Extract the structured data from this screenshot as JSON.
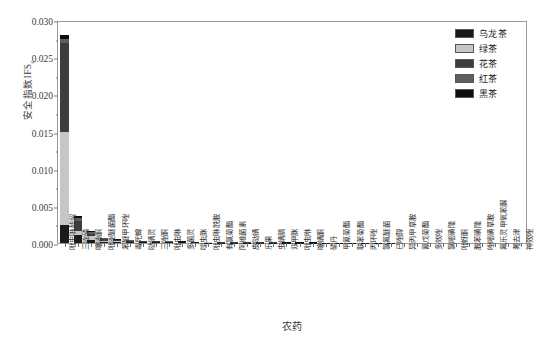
{
  "chart_data": {
    "type": "bar",
    "subtype": "stacked-bar",
    "title": "",
    "xlabel": "农药",
    "ylabel": "安全指数IFS",
    "ylabel_sub": "c",
    "ylim": [
      0.0,
      0.03
    ],
    "ytick_labels": [
      "0.000",
      "0.005",
      "0.010",
      "0.015",
      "0.020",
      "0.025",
      "0.030"
    ],
    "ytick_values": [
      0.0,
      0.005,
      0.01,
      0.015,
      0.02,
      0.025,
      0.03
    ],
    "grid": false,
    "legend_position": "top-right",
    "legend": [
      "乌龙茶",
      "绿茶",
      "花茶",
      "红茶",
      "黑茶"
    ],
    "colors": [
      "#1a1a1a",
      "#c6c6c6",
      "#3d3d3d",
      "#5e5e5e",
      "#0d0d0d"
    ],
    "categories": [
      "吡虫啉残留",
      "三唑磷",
      "噻嗪酮",
      "吡唑醚菌酯",
      "苯醚甲环唑",
      "毒死蜱",
      "哒螨灵",
      "三唑酮",
      "吡虫啉",
      "多菌灵",
      "啶虫脒",
      "吡虫啉酰胺",
      "有氯菊酯",
      "阿维菌素",
      "皮哒螨",
      "乐果",
      "虫螨腈",
      "双甲脒",
      "吡虫咻",
      "噻螨酮",
      "硫丹",
      "甲氰菊酯",
      "联苯菊酯",
      "丙环唑",
      "氯氟醚菌",
      "已唑醇",
      "异丙甲草胺",
      "氰戊菊酯",
      "多效唑",
      "氯嘧磺隆",
      "吡蚜酮",
      "胺苯磺隆",
      "唑嘧磺草胺",
      "氟乐灵甲氧苯脲",
      "莠去津",
      "神效唑"
    ],
    "series": [
      {
        "name": "乌龙茶",
        "color": "#1a1a1a",
        "values": [
          0.00245,
          0.00105,
          0.00042,
          0.0002,
          0.00016,
          0.00013,
          0.00011,
          0.0001,
          9e-05,
          8e-05,
          7e-05,
          6e-05,
          5e-05,
          5e-05,
          4e-05,
          4e-05,
          4e-05,
          3e-05,
          3e-05,
          3e-05,
          2e-05,
          2e-05,
          2e-05,
          2e-05,
          2e-05,
          2e-05,
          1e-05,
          1e-05,
          1e-05,
          1e-05,
          1e-05,
          1e-05,
          1e-05,
          1e-05,
          1e-05,
          1e-05
        ]
      },
      {
        "name": "绿茶",
        "color": "#c6c6c6",
        "values": [
          0.01255,
          0.00055,
          0.00048,
          8e-05,
          6e-05,
          5e-05,
          4e-05,
          4e-05,
          3e-05,
          3e-05,
          3e-05,
          2e-05,
          2e-05,
          2e-05,
          2e-05,
          2e-05,
          1e-05,
          1e-05,
          1e-05,
          1e-05,
          1e-05,
          1e-05,
          1e-05,
          1e-05,
          1e-05,
          1e-05,
          1e-05,
          1e-05,
          1e-05,
          1e-05,
          1e-05,
          0.0,
          0.0,
          0.0,
          0.0,
          0.0
        ]
      },
      {
        "name": "花茶",
        "color": "#3d3d3d",
        "values": [
          0.01185,
          0.0014,
          0.00038,
          0.00026,
          0.00016,
          0.00012,
          9e-05,
          8e-05,
          7e-05,
          6e-05,
          5e-05,
          5e-05,
          4e-05,
          4e-05,
          3e-05,
          3e-05,
          3e-05,
          2e-05,
          2e-05,
          2e-05,
          2e-05,
          2e-05,
          2e-05,
          1e-05,
          1e-05,
          1e-05,
          1e-05,
          1e-05,
          1e-05,
          1e-05,
          1e-05,
          1e-05,
          1e-05,
          1e-05,
          1e-05,
          1e-05
        ]
      },
      {
        "name": "红茶",
        "color": "#5e5e5e",
        "values": [
          0.00065,
          0.0004,
          0.0002,
          0.0001,
          8e-05,
          6e-05,
          5e-05,
          4e-05,
          4e-05,
          3e-05,
          3e-05,
          3e-05,
          2e-05,
          2e-05,
          2e-05,
          2e-05,
          2e-05,
          1e-05,
          1e-05,
          1e-05,
          1e-05,
          1e-05,
          1e-05,
          1e-05,
          1e-05,
          1e-05,
          1e-05,
          1e-05,
          1e-05,
          0.0,
          0.0,
          0.0,
          0.0,
          0.0,
          0.0,
          0.0
        ]
      },
      {
        "name": "黑茶",
        "color": "#0d0d0d",
        "values": [
          0.0005,
          0.0002,
          0.00012,
          6e-05,
          4e-05,
          4e-05,
          3e-05,
          3e-05,
          2e-05,
          2e-05,
          2e-05,
          2e-05,
          2e-05,
          1e-05,
          1e-05,
          1e-05,
          1e-05,
          1e-05,
          1e-05,
          1e-05,
          1e-05,
          1e-05,
          1e-05,
          1e-05,
          1e-05,
          1e-05,
          0.0,
          0.0,
          0.0,
          0.0,
          0.0,
          0.0,
          0.0,
          0.0,
          0.0,
          0.0
        ]
      }
    ]
  }
}
